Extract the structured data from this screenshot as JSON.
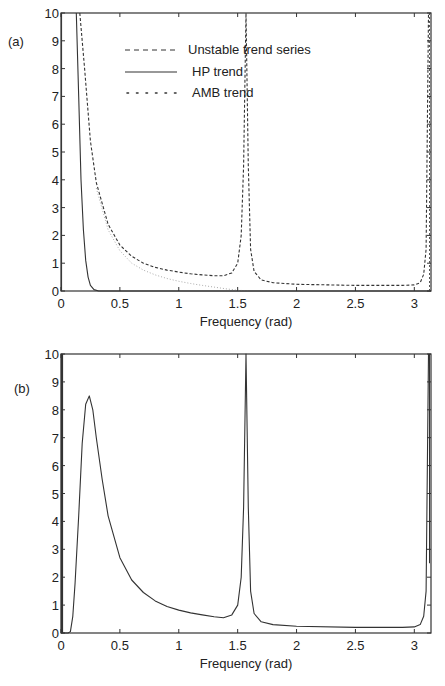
{
  "figure": {
    "panels": [
      {
        "label": "(a)",
        "xlabel": "Frequency (rad)"
      },
      {
        "label": "(b)",
        "xlabel": "Frequency (rad)"
      }
    ],
    "legend": [
      {
        "label": "Unstable trend series",
        "style": "dashed"
      },
      {
        "label": "HP trend",
        "style": "solid"
      },
      {
        "label": "AMB trend",
        "style": "dotted"
      }
    ],
    "x_ticks": [
      "0",
      "0.5",
      "1",
      "1.5",
      "2",
      "2.5",
      "3"
    ],
    "y_ticks": [
      "0",
      "1",
      "2",
      "3",
      "4",
      "5",
      "6",
      "7",
      "8",
      "9",
      "10"
    ]
  },
  "chart_data": [
    {
      "type": "line",
      "panel": "(a)",
      "title": "",
      "xlabel": "Frequency (rad)",
      "ylabel": "",
      "xlim": [
        0,
        3.1416
      ],
      "ylim": [
        0,
        10
      ],
      "grid": false,
      "legend_position": "upper center",
      "x_ticks": [
        0,
        0.5,
        1,
        1.5,
        2,
        2.5,
        3
      ],
      "y_ticks": [
        0,
        1,
        2,
        3,
        4,
        5,
        6,
        7,
        8,
        9,
        10
      ],
      "series": [
        {
          "name": "Unstable trend series",
          "style": "dashed",
          "x": [
            0.16,
            0.2,
            0.25,
            0.3,
            0.4,
            0.5,
            0.6,
            0.7,
            0.8,
            0.9,
            1.0,
            1.1,
            1.2,
            1.3,
            1.38,
            1.45,
            1.5,
            1.53,
            1.55,
            1.5708,
            1.59,
            1.61,
            1.64,
            1.7,
            1.8,
            2.0,
            2.5,
            2.9,
            3.0,
            3.05,
            3.08,
            3.1,
            3.12
          ],
          "y": [
            10,
            8.0,
            5.4,
            3.9,
            2.4,
            1.65,
            1.25,
            1.0,
            0.85,
            0.75,
            0.68,
            0.62,
            0.58,
            0.55,
            0.55,
            0.65,
            1.0,
            2.0,
            4.5,
            10,
            4.5,
            1.5,
            0.7,
            0.4,
            0.3,
            0.24,
            0.2,
            0.2,
            0.22,
            0.3,
            0.6,
            1.5,
            10
          ]
        },
        {
          "name": "HP trend",
          "style": "solid",
          "x": [
            0.13,
            0.15,
            0.17,
            0.19,
            0.21,
            0.23,
            0.25,
            0.28,
            0.32,
            0.4,
            3.1416
          ],
          "y": [
            10,
            7.0,
            4.0,
            2.2,
            1.1,
            0.5,
            0.2,
            0.05,
            0.0,
            0.0,
            0.0
          ],
          "note": "also a vertical solid segment near x=0 at the left axis"
        },
        {
          "name": "AMB trend",
          "style": "dotted",
          "x": [
            0.3,
            0.4,
            0.5,
            0.6,
            0.7,
            0.8,
            0.9,
            1.0,
            1.1,
            1.2,
            1.3,
            1.4,
            1.5,
            1.6
          ],
          "y": [
            3.7,
            2.2,
            1.45,
            1.0,
            0.75,
            0.58,
            0.45,
            0.35,
            0.27,
            0.2,
            0.14,
            0.08,
            0.03,
            0.0
          ]
        }
      ]
    },
    {
      "type": "line",
      "panel": "(b)",
      "title": "",
      "xlabel": "Frequency (rad)",
      "ylabel": "",
      "xlim": [
        0,
        3.1416
      ],
      "ylim": [
        0,
        10
      ],
      "grid": false,
      "x_ticks": [
        0,
        0.5,
        1,
        1.5,
        2,
        2.5,
        3
      ],
      "y_ticks": [
        0,
        1,
        2,
        3,
        4,
        5,
        6,
        7,
        8,
        9,
        10
      ],
      "series": [
        {
          "name": "Filtered series",
          "style": "solid",
          "x": [
            0.0,
            0.06,
            0.08,
            0.1,
            0.12,
            0.15,
            0.18,
            0.21,
            0.24,
            0.27,
            0.3,
            0.35,
            0.4,
            0.5,
            0.6,
            0.7,
            0.8,
            0.9,
            1.0,
            1.1,
            1.2,
            1.3,
            1.38,
            1.45,
            1.5,
            1.53,
            1.55,
            1.5708,
            1.59,
            1.61,
            1.64,
            1.7,
            1.8,
            2.0,
            2.5,
            2.9,
            3.0,
            3.05,
            3.08,
            3.1,
            3.12
          ],
          "y": [
            0,
            0,
            0.05,
            0.6,
            1.8,
            4.2,
            6.8,
            8.2,
            8.5,
            8.0,
            7.0,
            5.5,
            4.2,
            2.7,
            1.9,
            1.45,
            1.15,
            0.95,
            0.82,
            0.72,
            0.65,
            0.58,
            0.55,
            0.65,
            1.0,
            2.0,
            4.5,
            10,
            4.5,
            1.5,
            0.7,
            0.4,
            0.3,
            0.24,
            0.2,
            0.2,
            0.22,
            0.3,
            0.6,
            1.5,
            10
          ]
        }
      ]
    }
  ]
}
